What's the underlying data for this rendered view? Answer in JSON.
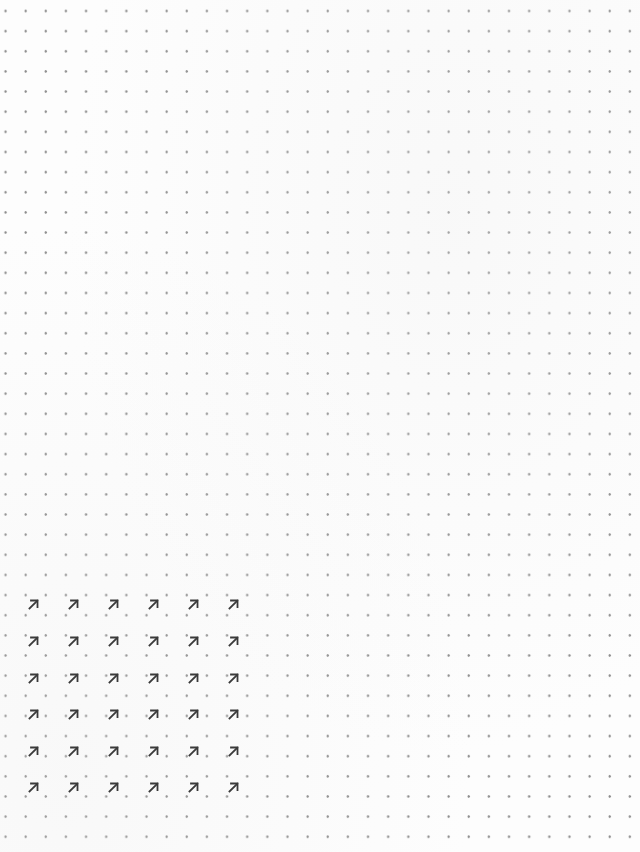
{
  "page": {
    "type": "dot-grid-paper",
    "background_color": "#fdfdfd",
    "dot_color": "#8c8c8c",
    "dot_pitch_px": 20.15
  },
  "arrow_grid": {
    "glyph": "↗",
    "icon": "arrow-up-right-icon",
    "color": "#3a3a3a",
    "columns_x": [
      33,
      73,
      113,
      153,
      193,
      233
    ],
    "rows_y": [
      604,
      641,
      678,
      714,
      751,
      787
    ],
    "rows": 6,
    "cols": 6
  }
}
